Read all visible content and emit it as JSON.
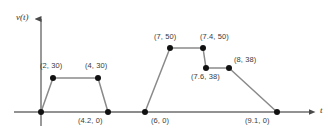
{
  "figure": {
    "width": 328,
    "height": 133,
    "background": "#ffffff",
    "line_color": "#8a8a8a",
    "marker_color": "#111111",
    "axis_color": "#6e6e6e",
    "label_color": "#3a3a3a"
  },
  "axes": {
    "y_axis_label": "v(t)",
    "x_axis_label": "t",
    "origin_px": {
      "x": 41,
      "y": 112
    },
    "x_axis_y_px": 112,
    "y_axis_x_px": 41,
    "x_axis_end_px": 316,
    "y_axis_top_px": 12,
    "y_axis_bottom_px": 126,
    "px_per_x_unit": 26.1,
    "px_per_y_unit": 1.28
  },
  "chart_data": {
    "type": "line",
    "title": "",
    "subtitle": "",
    "xlabel": "t",
    "ylabel": "v(t)",
    "grid": false,
    "legend": false,
    "legend_position": "none",
    "xlim": [
      0,
      10.5
    ],
    "ylim": [
      0,
      58
    ],
    "x": [
      0,
      2,
      4,
      4.2,
      6,
      7,
      7.4,
      7.6,
      8,
      9.1
    ],
    "y": [
      0,
      30,
      30,
      0,
      0,
      50,
      50,
      38,
      38,
      0
    ],
    "series": [
      {
        "name": "v(t)",
        "points": [
          {
            "x": 0,
            "y": 0,
            "label": "",
            "px": 41,
            "py": 112,
            "label_x": 0,
            "label_y": 0,
            "show_label": false
          },
          {
            "x": 2,
            "y": 30,
            "label": "(2, 30)",
            "px": 53,
            "py": 78,
            "label_x": 40,
            "label_y": 62,
            "show_label": true
          },
          {
            "x": 4,
            "y": 30,
            "label": "(4, 30)",
            "px": 98,
            "py": 78,
            "label_x": 85,
            "label_y": 62,
            "show_label": true
          },
          {
            "x": 4.2,
            "y": 0,
            "label": "(4.2, 0)",
            "px": 108,
            "py": 112,
            "label_x": 78,
            "label_y": 117,
            "show_label": true
          },
          {
            "x": 6,
            "y": 0,
            "label": "(6, 0)",
            "px": 145,
            "py": 112,
            "label_x": 151,
            "label_y": 117,
            "show_label": true
          },
          {
            "x": 7,
            "y": 50,
            "label": "(7, 50)",
            "px": 170,
            "py": 48,
            "label_x": 154,
            "label_y": 33,
            "show_label": true
          },
          {
            "x": 7.4,
            "y": 50,
            "label": "(7.4, 50)",
            "px": 203,
            "py": 48,
            "label_x": 200,
            "label_y": 33,
            "show_label": true
          },
          {
            "x": 7.6,
            "y": 38,
            "label": "(7.6, 38)",
            "px": 206,
            "py": 68,
            "label_x": 191,
            "label_y": 73,
            "show_label": true
          },
          {
            "x": 8,
            "y": 38,
            "label": "(8, 38)",
            "px": 229,
            "py": 68,
            "label_x": 234,
            "label_y": 56,
            "show_label": true
          },
          {
            "x": 9.1,
            "y": 0,
            "label": "(9.1, 0)",
            "px": 277,
            "py": 112,
            "label_x": 245,
            "label_y": 117,
            "show_label": true
          }
        ]
      }
    ],
    "annotations": [
      {
        "text": "v(t)",
        "role": "y-axis-label",
        "x_px": 16,
        "y_px": 14
      },
      {
        "text": "t",
        "role": "x-axis-label",
        "x_px": 320,
        "y_px": 107
      }
    ]
  }
}
